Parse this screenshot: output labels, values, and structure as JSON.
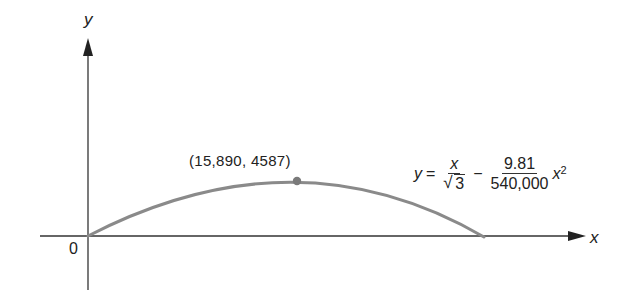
{
  "diagram": {
    "axes": {
      "x_label": "x",
      "y_label": "y",
      "origin_label": "0"
    },
    "curve": {
      "description": "Projectile trajectory (parabola) from origin, peaking and returning to x-axis",
      "color": "#8a8a8a"
    },
    "peak_point": {
      "label": "(15,890, 4587)",
      "x": 15890,
      "y": 4587,
      "color": "#8a8a8a"
    },
    "equation": {
      "lhs": "y",
      "equals": "=",
      "term1_numerator": "x",
      "term1_denominator_radicand": "3",
      "minus": "−",
      "term2_numerator": "9.81",
      "term2_denominator": "540,000",
      "term2_variable": "x",
      "term2_exponent": "2"
    }
  }
}
